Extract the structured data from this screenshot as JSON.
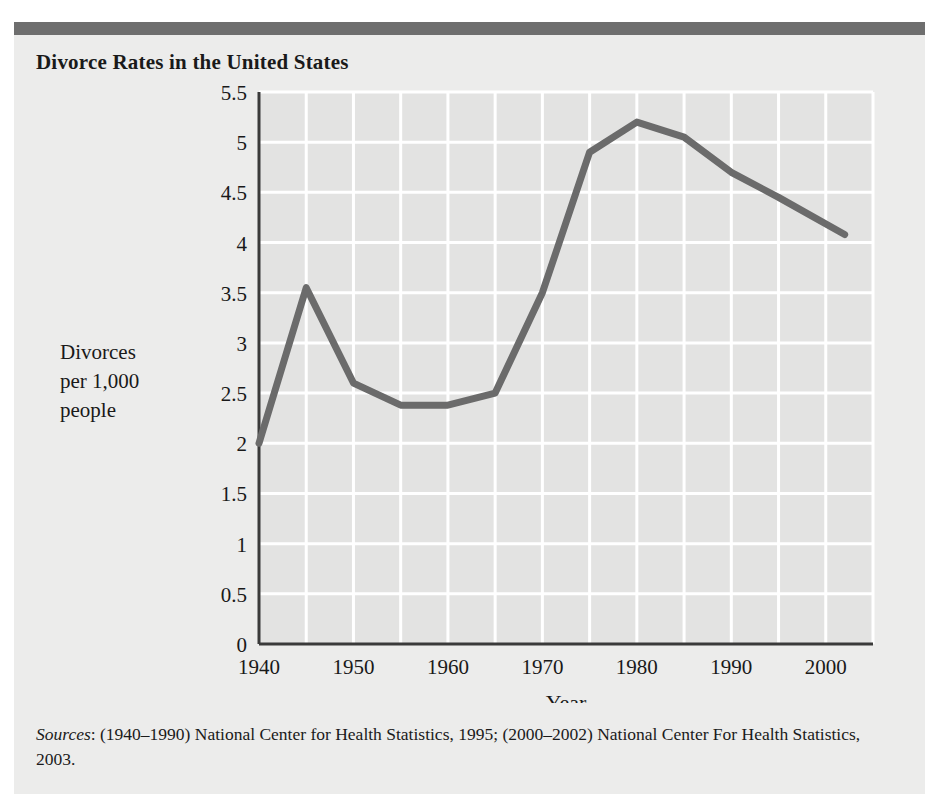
{
  "page": {
    "background_color": "#ececeb",
    "rule_color": "#6e6e6e"
  },
  "figure": {
    "title": "Divorce Rates in the United States"
  },
  "source_note": {
    "label": "Sources",
    "text": ": (1940–1990) National Center for Health Statistics, 1995; (2000–2002) National Center For Health Statistics, 2003."
  },
  "y_axis_label": {
    "line1": "Divorces",
    "line2": "per 1,000",
    "line3": "people"
  },
  "chart_data": {
    "type": "line",
    "title": "Divorce Rates in the United States",
    "xlabel": "Year",
    "ylabel": "Divorces per 1,000 people",
    "xlim": [
      1940,
      2005
    ],
    "ylim": [
      0,
      5.5
    ],
    "grid": true,
    "grid_color": "#ffffff",
    "plot_background": "#e3e3e2",
    "axis_color": "#3a3a3a",
    "line_color": "#6b6b6b",
    "line_width": 7,
    "legend": "none",
    "x_ticks": [
      1940,
      1950,
      1960,
      1970,
      1980,
      1990,
      2000
    ],
    "x_tick_labels": [
      "1940",
      "1950",
      "1960",
      "1970",
      "1980",
      "1990",
      "2000"
    ],
    "x_gridlines": [
      1945,
      1950,
      1955,
      1960,
      1965,
      1970,
      1975,
      1980,
      1985,
      1990,
      1995,
      2000,
      2005
    ],
    "y_ticks": [
      0,
      0.5,
      1,
      1.5,
      2,
      2.5,
      3,
      3.5,
      4,
      4.5,
      5,
      5.5
    ],
    "y_tick_labels": [
      "0",
      "0.5",
      "1",
      "1.5",
      "2",
      "2.5",
      "3",
      "3.5",
      "4",
      "4.5",
      "5",
      "5.5"
    ],
    "x": [
      1940,
      1945,
      1950,
      1955,
      1960,
      1965,
      1970,
      1975,
      1980,
      1985,
      1990,
      1995,
      2002
    ],
    "values": [
      2.0,
      3.55,
      2.6,
      2.38,
      2.38,
      2.5,
      3.5,
      4.9,
      5.2,
      5.05,
      4.7,
      4.45,
      4.08
    ],
    "series": [
      {
        "name": "Divorces per 1,000 people",
        "values": [
          2.0,
          3.55,
          2.6,
          2.38,
          2.38,
          2.5,
          3.5,
          4.9,
          5.2,
          5.05,
          4.7,
          4.45,
          4.08
        ]
      }
    ]
  }
}
